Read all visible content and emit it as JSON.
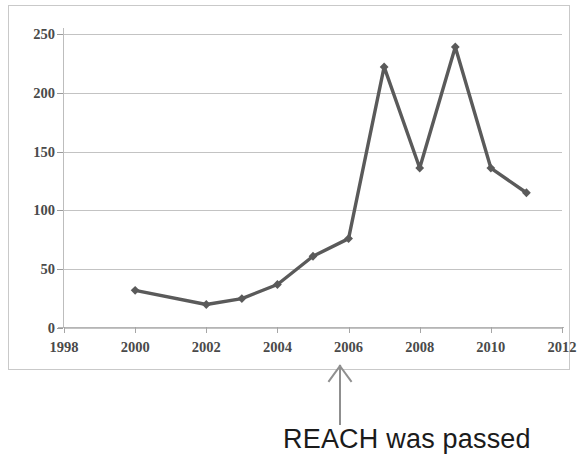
{
  "chart_data": {
    "type": "line",
    "title": "",
    "subtitle": "",
    "xlabel": "",
    "ylabel": "",
    "xlim": [
      1998,
      2012
    ],
    "ylim": [
      0,
      250
    ],
    "grid": true,
    "legend": false,
    "x_ticks": [
      "1998",
      "2000",
      "2002",
      "2004",
      "2006",
      "2008",
      "2010",
      "2012"
    ],
    "x_tick_values": [
      1998,
      2000,
      2002,
      2004,
      2006,
      2008,
      2010,
      2012
    ],
    "y_ticks": [
      "0",
      "50",
      "100",
      "150",
      "200",
      "250"
    ],
    "y_tick_values": [
      0,
      50,
      100,
      150,
      200,
      250
    ],
    "x": [
      2000,
      2002,
      2003,
      2004,
      2005,
      2006,
      2007,
      2008,
      2009,
      2010,
      2011
    ],
    "values": [
      32,
      20,
      25,
      37,
      61,
      76,
      222,
      136,
      239,
      136,
      115
    ],
    "series": [
      {
        "name": "",
        "x": [
          2000,
          2002,
          2003,
          2004,
          2005,
          2006,
          2007,
          2008,
          2009,
          2010,
          2011
        ],
        "values": [
          32,
          20,
          25,
          37,
          61,
          76,
          222,
          136,
          239,
          136,
          115
        ],
        "color": "#5a5a5a",
        "marker": "diamond",
        "line_width": 3.4
      }
    ],
    "annotations": [
      {
        "text": "REACH was passed",
        "target_x": 2006,
        "type": "up-arrow-callout"
      }
    ],
    "colors": {
      "series": "#5a5a5a",
      "gridline": "#c3c3c3",
      "axis": "#b5b5b5",
      "tick_label": "#4a4a4a",
      "annotation_text": "#1b1b1b",
      "frame": "#c9c9c9",
      "background": "#ffffff"
    }
  },
  "annotation": {
    "label": "REACH was passed"
  }
}
